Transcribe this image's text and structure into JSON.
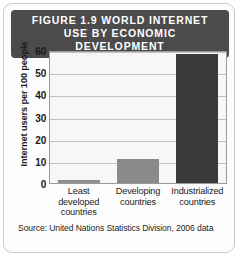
{
  "figure": {
    "title": "FIGURE 1.9 WORLD INTERNET USE BY ECONOMIC DEVELOPMENT",
    "source": "Source: United Nations Statistics Division, 2006 data",
    "title_bg": "#4b4b4b",
    "title_color": "#ffffff",
    "border_color": "#c9c9c9"
  },
  "chart_data": {
    "type": "bar",
    "title": "FIGURE 1.9 WORLD INTERNET USE BY ECONOMIC DEVELOPMENT",
    "categories": [
      "Least developed countries",
      "Developing countries",
      "Industrialized countries"
    ],
    "category_lines": [
      [
        "Least",
        "developed",
        "countries"
      ],
      [
        "Developing",
        "countries"
      ],
      [
        "Industrialized",
        "countries"
      ]
    ],
    "values": [
      1.3,
      11,
      58
    ],
    "xlabel": "",
    "ylabel": "Internet users per 100 people",
    "ylim": [
      0,
      60
    ],
    "yticks": [
      0,
      10,
      20,
      30,
      40,
      50,
      60
    ],
    "grid": true,
    "legend": "none",
    "bar_colors": [
      "#8f8f8f",
      "#8a8a8a",
      "#3a3a3a"
    ],
    "source": "Source: United Nations Statistics Division, 2006 data"
  }
}
